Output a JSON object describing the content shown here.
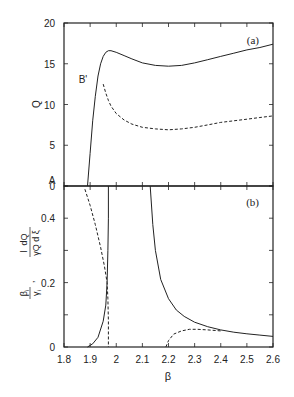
{
  "chart_data": [
    {
      "type": "line",
      "panel_label": "(a)",
      "title": "",
      "xlabel": "",
      "ylabel": "Q",
      "xlim": [
        1.8,
        2.6
      ],
      "ylim": [
        0,
        20
      ],
      "yticks": [
        "0",
        "5",
        "10",
        "15",
        "20"
      ],
      "annotations": [
        {
          "text": "A",
          "x": 1.87,
          "y": 0.6
        },
        {
          "text": "B'",
          "x": 1.92,
          "y": 12.8
        }
      ],
      "series": [
        {
          "name": "solid",
          "style": "solid",
          "x": [
            1.89,
            1.9,
            1.91,
            1.92,
            1.93,
            1.94,
            1.95,
            1.96,
            1.97,
            1.98,
            2.0,
            2.03,
            2.06,
            2.1,
            2.15,
            2.2,
            2.25,
            2.3,
            2.35,
            2.4,
            2.45,
            2.5,
            2.55,
            2.6
          ],
          "y": [
            0,
            4.0,
            8.0,
            11.0,
            13.5,
            15.0,
            15.9,
            16.4,
            16.6,
            16.6,
            16.4,
            16.0,
            15.6,
            15.1,
            14.8,
            14.7,
            14.8,
            15.1,
            15.5,
            15.9,
            16.3,
            16.7,
            17.0,
            17.4
          ]
        },
        {
          "name": "dashed",
          "style": "dashed",
          "x": [
            1.95,
            1.96,
            1.97,
            1.98,
            2.0,
            2.03,
            2.06,
            2.1,
            2.15,
            2.2,
            2.25,
            2.3,
            2.35,
            2.4,
            2.45,
            2.5,
            2.55,
            2.6
          ],
          "y": [
            12.5,
            11.4,
            10.5,
            9.8,
            8.9,
            8.1,
            7.6,
            7.2,
            7.0,
            6.9,
            7.0,
            7.2,
            7.5,
            7.8,
            8.0,
            8.2,
            8.4,
            8.6
          ]
        }
      ]
    },
    {
      "type": "line",
      "panel_label": "(b)",
      "title": "",
      "xlabel": "β",
      "ylabel": "β_i/γ_i , (1/γQ) dQ/dξ",
      "xlim": [
        1.8,
        2.6
      ],
      "ylim": [
        0,
        0.5
      ],
      "xticks": [
        "1.8",
        "1.9",
        "2",
        "2.1",
        "2.2",
        "2.3",
        "2.4",
        "2.5",
        "2.6"
      ],
      "yticks": [
        "0",
        "0.2",
        "0.4"
      ],
      "series": [
        {
          "name": "solid-left",
          "style": "solid",
          "x": [
            1.89,
            1.91,
            1.93,
            1.95,
            1.96,
            1.965,
            1.968,
            1.97,
            1.97
          ],
          "y": [
            0,
            0.01,
            0.03,
            0.08,
            0.13,
            0.2,
            0.3,
            0.4,
            0.5
          ]
        },
        {
          "name": "dashed-left",
          "style": "dashed",
          "x": [
            1.88,
            1.9,
            1.92,
            1.94,
            1.955,
            1.965,
            1.968,
            1.97,
            1.97
          ],
          "y": [
            0.49,
            0.44,
            0.38,
            0.31,
            0.25,
            0.2,
            0.15,
            0.08,
            0
          ]
        },
        {
          "name": "solid-right",
          "style": "solid",
          "x": [
            2.13,
            2.14,
            2.15,
            2.17,
            2.2,
            2.23,
            2.26,
            2.3,
            2.35,
            2.4,
            2.45,
            2.5,
            2.55,
            2.6
          ],
          "y": [
            0.5,
            0.38,
            0.3,
            0.21,
            0.15,
            0.115,
            0.095,
            0.077,
            0.063,
            0.053,
            0.046,
            0.041,
            0.037,
            0.033
          ]
        },
        {
          "name": "dashed-right",
          "style": "dashed",
          "x": [
            2.19,
            2.2,
            2.22,
            2.25,
            2.28,
            2.31,
            2.35,
            2.4
          ],
          "y": [
            0,
            0.02,
            0.04,
            0.05,
            0.055,
            0.055,
            0.053,
            0.05
          ]
        }
      ]
    }
  ],
  "panel_a": {
    "label": "(a)",
    "ylabel": "Q",
    "ann_a": "A",
    "ann_b": "B'"
  },
  "panel_b": {
    "label": "(b)",
    "xlabel": "β"
  }
}
